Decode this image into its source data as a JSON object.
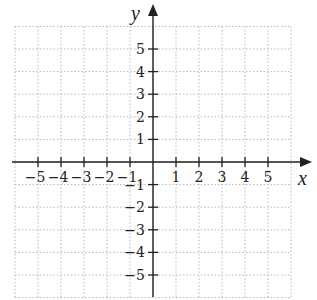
{
  "chart_data": {
    "type": "scatter",
    "title": "",
    "xlabel": "x",
    "ylabel": "y",
    "xlim": [
      -6,
      6
    ],
    "ylim": [
      -6,
      6
    ],
    "grid": true,
    "grid_style": "dotted",
    "x_ticks": [
      -5,
      -4,
      -3,
      -2,
      -1,
      1,
      2,
      3,
      4,
      5
    ],
    "y_ticks": [
      5,
      4,
      3,
      2,
      1,
      -1,
      -2,
      -3,
      -4,
      -5
    ],
    "x_tick_labels": [
      "−5",
      "−4",
      "−3",
      "−2",
      "−1",
      "1",
      "2",
      "3",
      "4",
      "5"
    ],
    "y_tick_labels": [
      "5",
      "4",
      "3",
      "2",
      "1",
      "−1",
      "−2",
      "−3",
      "−4",
      "−5"
    ],
    "series": []
  },
  "colors": {
    "axis": "#222222",
    "grid": "#b8b8b8"
  }
}
